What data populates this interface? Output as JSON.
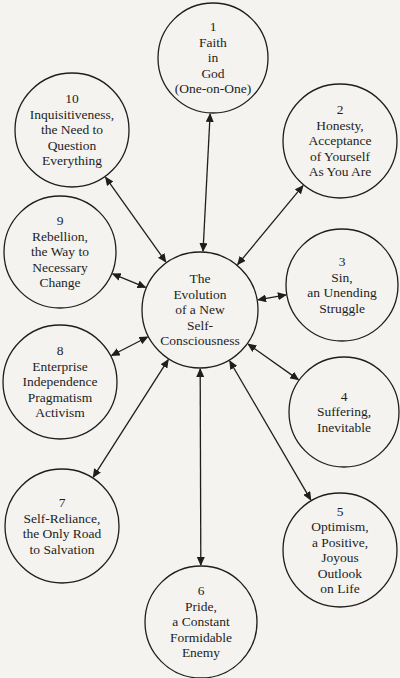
{
  "center": {
    "lines": [
      "The",
      "Evolution",
      "of a New",
      "Self-",
      "Consciousness"
    ],
    "x": 200,
    "y": 310,
    "r": 58
  },
  "nodes": [
    {
      "number": "1",
      "lines": [
        "Faith",
        "in",
        "God",
        "(One-on-One)"
      ],
      "x": 213,
      "y": 58,
      "r": 55
    },
    {
      "number": "2",
      "lines": [
        "Honesty,",
        "Acceptance",
        "of Yourself",
        "As You Are"
      ],
      "x": 340,
      "y": 141,
      "r": 57
    },
    {
      "number": "3",
      "lines": [
        "Sin,",
        "an Unending",
        "Struggle"
      ],
      "x": 342,
      "y": 285,
      "r": 56
    },
    {
      "number": "4",
      "lines": [
        "Suffering,",
        "Inevitable"
      ],
      "x": 344,
      "y": 412,
      "r": 55
    },
    {
      "number": "5",
      "lines": [
        "Optimism,",
        "a Positive,",
        "Joyous",
        "Outlook",
        "on Life"
      ],
      "x": 340,
      "y": 550,
      "r": 57
    },
    {
      "number": "6",
      "lines": [
        "Pride,",
        "a Constant",
        "Formidable",
        "Enemy"
      ],
      "x": 201,
      "y": 622,
      "r": 56
    },
    {
      "number": "7",
      "lines": [
        "Self-Reliance,",
        "the Only Road",
        "to Salvation"
      ],
      "x": 62,
      "y": 526,
      "r": 57
    },
    {
      "number": "8",
      "lines": [
        "Enterprise",
        "Independence",
        "Pragmatism",
        "Activism"
      ],
      "x": 60,
      "y": 382,
      "r": 57
    },
    {
      "number": "9",
      "lines": [
        "Rebellion,",
        "the Way to",
        "Necessary",
        "Change"
      ],
      "x": 60,
      "y": 252,
      "r": 56
    },
    {
      "number": "10",
      "lines": [
        "Inquisitiveness,",
        "the Need to",
        "Question",
        "Everything"
      ],
      "x": 72,
      "y": 130,
      "r": 57
    }
  ],
  "colors": {
    "ink": "#1e1e1e",
    "paper": "#f4f3ef"
  }
}
